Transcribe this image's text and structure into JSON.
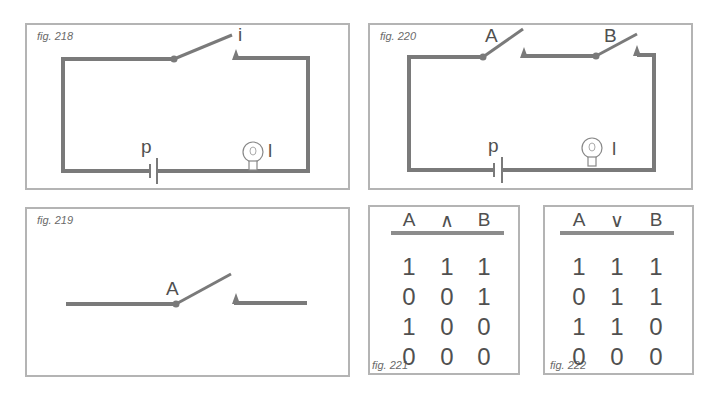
{
  "figures": {
    "fig218": {
      "label": "fig. 218",
      "switch_label": "i",
      "battery_label": "p",
      "lamp_label": "l"
    },
    "fig220": {
      "label": "fig. 220",
      "switch_a_label": "A",
      "switch_b_label": "B",
      "battery_label": "p",
      "lamp_label": "l"
    },
    "fig219": {
      "label": "fig. 219",
      "switch_label": "A"
    },
    "fig221": {
      "label": "fig. 221",
      "headers": [
        "A",
        "∧",
        "B"
      ],
      "rows": [
        [
          "1",
          "1",
          "1"
        ],
        [
          "0",
          "0",
          "1"
        ],
        [
          "1",
          "0",
          "0"
        ],
        [
          "0",
          "0",
          "0"
        ]
      ]
    },
    "fig222": {
      "label": "fig. 222",
      "headers": [
        "A",
        "∨",
        "B"
      ],
      "rows": [
        [
          "1",
          "1",
          "1"
        ],
        [
          "0",
          "1",
          "1"
        ],
        [
          "1",
          "1",
          "0"
        ],
        [
          "0",
          "0",
          "0"
        ]
      ]
    }
  },
  "colors": {
    "wire": "#7a7a7a",
    "border": "#b4b4b4",
    "text": "#505050"
  }
}
